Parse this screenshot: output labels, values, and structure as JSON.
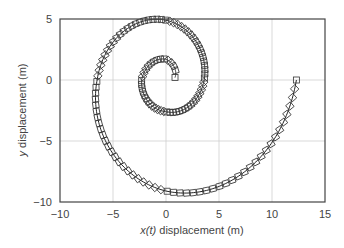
{
  "chart_data": {
    "type": "line",
    "title": "",
    "xlabel_italic": "x(t)",
    "xlabel_rest": " displacement (m)",
    "ylabel_italic": "y",
    "ylabel_rest": " displacement (m)",
    "xlim": [
      -10,
      15
    ],
    "ylim": [
      -10,
      5
    ],
    "xticks": [
      -10,
      -5,
      0,
      5,
      10,
      15
    ],
    "yticks": [
      -10,
      -5,
      0,
      5
    ],
    "xtick_labels": [
      "−10",
      "−5",
      "0",
      "5",
      "10",
      "15"
    ],
    "ytick_labels": [
      "−10",
      "−5",
      "0",
      "5"
    ],
    "grid": true,
    "legend": "none",
    "series": [
      {
        "name": "trajectory",
        "style": "solid line with square markers",
        "description": "Outward spiral starting near (0.85, 0.2), counter-clockwise, ending at (12.3, 0)",
        "quarter_turn_radii": [
          0.85,
          1.6,
          2.3,
          2.6,
          3.6,
          4.9,
          6.5,
          9.1,
          12.3
        ],
        "key_points": [
          {
            "x": 0.85,
            "y": 0.2
          },
          {
            "x": -0.1,
            "y": 1.6
          },
          {
            "x": -2.3,
            "y": 0.0
          },
          {
            "x": 0.4,
            "y": -2.6
          },
          {
            "x": 3.6,
            "y": 0.0
          },
          {
            "x": -0.8,
            "y": 4.9
          },
          {
            "x": -6.5,
            "y": 0.0
          },
          {
            "x": 1.0,
            "y": -9.1
          },
          {
            "x": 12.3,
            "y": 0.0
          }
        ],
        "marker_count": 130
      }
    ]
  }
}
